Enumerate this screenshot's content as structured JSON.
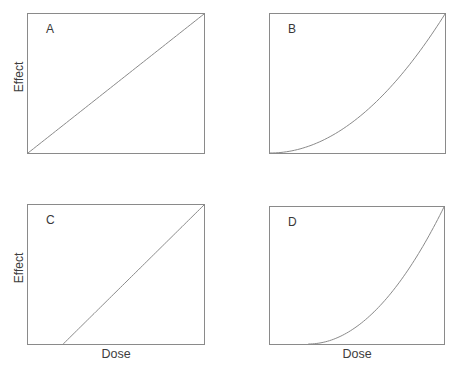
{
  "figure": {
    "background_color": "#ffffff",
    "line_color": "#8a8a8a",
    "text_color": "#3d3d3d"
  },
  "chart_data": {
    "type": "line",
    "layout": "2x2 panel grid",
    "title": "",
    "xlabel": "Dose",
    "ylabel": "Effect",
    "axis_range": {
      "x": [
        0,
        1
      ],
      "y": [
        0,
        1
      ]
    },
    "grid": false,
    "legend": "none",
    "panels": [
      {
        "label": "A",
        "ylabel": "Effect",
        "xlabel": "",
        "shape": "linear",
        "threshold": 0,
        "power": 1,
        "points": [
          [
            0,
            0
          ],
          [
            0.25,
            0.25
          ],
          [
            0.5,
            0.5
          ],
          [
            0.75,
            0.75
          ],
          [
            1,
            1
          ]
        ]
      },
      {
        "label": "B",
        "ylabel": "",
        "xlabel": "",
        "shape": "convex",
        "threshold": 0,
        "power": 2,
        "points": [
          [
            0,
            0
          ],
          [
            0.25,
            0.06
          ],
          [
            0.5,
            0.27
          ],
          [
            0.75,
            0.57
          ],
          [
            1,
            1
          ]
        ]
      },
      {
        "label": "C",
        "ylabel": "Effect",
        "xlabel": "Dose",
        "shape": "linear",
        "threshold": 0.2,
        "power": 1,
        "points": [
          [
            0.2,
            0
          ],
          [
            0.4,
            0.25
          ],
          [
            0.6,
            0.5
          ],
          [
            0.8,
            0.75
          ],
          [
            1,
            1
          ]
        ]
      },
      {
        "label": "D",
        "ylabel": "",
        "xlabel": "Dose",
        "shape": "convex",
        "threshold": 0.22,
        "power": 2,
        "points": [
          [
            0.22,
            0
          ],
          [
            0.4,
            0.05
          ],
          [
            0.6,
            0.24
          ],
          [
            0.8,
            0.55
          ],
          [
            1,
            1
          ]
        ]
      }
    ]
  }
}
